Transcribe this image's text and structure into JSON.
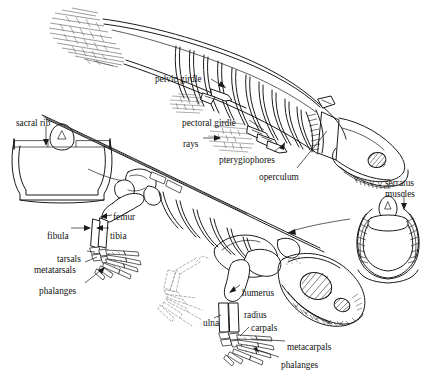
{
  "figure": {
    "ink_color": "#1a1a1a",
    "background_color": "#ffffff",
    "ghost_color": "#9a9a9a"
  },
  "labels": [
    {
      "id": "pelvic-girdle",
      "text": "pelvic girdle",
      "x": 155,
      "y": 74,
      "align": "left"
    },
    {
      "id": "pectoral-girdle",
      "text": "pectoral girdle",
      "x": 182,
      "y": 118,
      "align": "left"
    },
    {
      "id": "rays",
      "text": "rays",
      "x": 183,
      "y": 139,
      "align": "left"
    },
    {
      "id": "pterygiophores",
      "text": "pterygiophores",
      "x": 219,
      "y": 155,
      "align": "left"
    },
    {
      "id": "operculum",
      "text": "operculum",
      "x": 259,
      "y": 172,
      "align": "left"
    },
    {
      "id": "sacral-rib",
      "text": "sacral rib",
      "x": 16,
      "y": 118,
      "align": "left"
    },
    {
      "id": "femur",
      "text": "femur",
      "x": 113,
      "y": 212,
      "align": "left"
    },
    {
      "id": "fibula",
      "text": "fibula",
      "x": 47,
      "y": 231,
      "align": "left"
    },
    {
      "id": "tibia",
      "text": "tibia",
      "x": 110,
      "y": 231,
      "align": "left"
    },
    {
      "id": "tarsals",
      "text": "tarsals",
      "x": 57,
      "y": 254,
      "align": "left"
    },
    {
      "id": "metatarsals",
      "text": "metatarsals",
      "x": 34,
      "y": 265,
      "align": "left"
    },
    {
      "id": "phalanges-foot",
      "text": "phalanges",
      "x": 39,
      "y": 286,
      "align": "left"
    },
    {
      "id": "humerus",
      "text": "humerus",
      "x": 242,
      "y": 288,
      "align": "left"
    },
    {
      "id": "ulna",
      "text": "ulna",
      "x": 203,
      "y": 318,
      "align": "left"
    },
    {
      "id": "radius",
      "text": "radius",
      "x": 244,
      "y": 310,
      "align": "left"
    },
    {
      "id": "carpals",
      "text": "carpals",
      "x": 251,
      "y": 323,
      "align": "left"
    },
    {
      "id": "metacarpals",
      "text": "metacarpals",
      "x": 287,
      "y": 342,
      "align": "left"
    },
    {
      "id": "phalanges-hand",
      "text": "phalanges",
      "x": 281,
      "y": 360,
      "align": "left"
    },
    {
      "id": "serratus-l1",
      "text": "serratus",
      "x": 385,
      "y": 178,
      "align": "left"
    },
    {
      "id": "serratus-l2",
      "text": "muscles",
      "x": 385,
      "y": 189,
      "align": "left"
    }
  ],
  "parts": {
    "fish": {
      "name": "lobe-finned fish skeleton",
      "features": [
        "caudal fin",
        "vertebral column",
        "ribs",
        "pelvic girdle",
        "pectoral girdle",
        "fin rays",
        "pterygiophores",
        "operculum",
        "skull",
        "orbit",
        "teeth"
      ]
    },
    "tetrapod": {
      "name": "early tetrapod skeleton",
      "features": [
        "vertebral column",
        "ribs",
        "pelvic girdle",
        "hind limb",
        "fore limb",
        "skull",
        "orbit",
        "naris",
        "teeth",
        "ghost fore limb"
      ]
    },
    "inset_sacral": {
      "name": "sacral rib cross-section"
    },
    "inset_serratus": {
      "name": "serratus muscles cross-section"
    }
  }
}
